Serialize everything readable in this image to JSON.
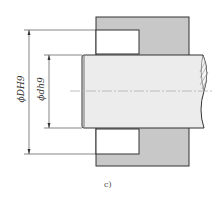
{
  "diagram": {
    "caption": "c)",
    "dimensions": [
      {
        "id": "outer",
        "label": "ϕDH9"
      },
      {
        "id": "inner",
        "label": "ϕdh9"
      }
    ],
    "colors": {
      "housing": "#c8c8c8",
      "shaft": "#ececec",
      "line": "#333333",
      "centerline": "#b0b0b0"
    }
  }
}
